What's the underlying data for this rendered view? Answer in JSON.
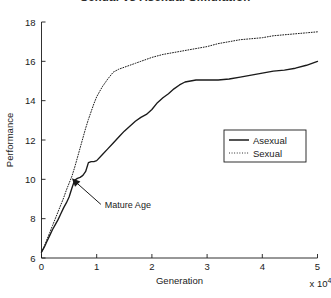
{
  "figure": {
    "title": "Sexual vs Asexual Simulation",
    "background_color": "#ffffff",
    "axis_color": "#1a1a1a",
    "series_color": "#1a1a1a"
  },
  "annotation": {
    "label": "Mature Age",
    "target_x": 0.55,
    "target_y": 10.05
  },
  "legend": {
    "position": "center-right",
    "entries": [
      {
        "label": "Asexual",
        "style": "solid"
      },
      {
        "label": "Sexual",
        "style": "dotted"
      }
    ]
  },
  "axis_text": {
    "exponent_base": "x 10",
    "exponent_power": "4"
  },
  "chart_data": {
    "type": "line",
    "title": "Sexual vs Asexual Simulation",
    "xlabel": "Generation",
    "ylabel": "Performance",
    "x_multiplier": "x 10^4",
    "xlim": [
      0,
      5
    ],
    "ylim": [
      6,
      18
    ],
    "xticks": [
      0,
      1,
      2,
      3,
      4,
      5
    ],
    "yticks": [
      6,
      8,
      10,
      12,
      14,
      16,
      18
    ],
    "grid": false,
    "legend_position": "center-right",
    "annotations": [
      {
        "text": "Mature Age",
        "x": 0.55,
        "y": 10.05
      }
    ],
    "series": [
      {
        "name": "Asexual",
        "style": "solid",
        "x": [
          0.0,
          0.05,
          0.1,
          0.15,
          0.2,
          0.25,
          0.3,
          0.35,
          0.4,
          0.45,
          0.5,
          0.55,
          0.6,
          0.65,
          0.7,
          0.75,
          0.8,
          0.85,
          0.9,
          0.95,
          1.0,
          1.1,
          1.2,
          1.3,
          1.4,
          1.5,
          1.6,
          1.7,
          1.8,
          1.9,
          2.0,
          2.1,
          2.2,
          2.3,
          2.4,
          2.5,
          2.6,
          2.7,
          2.8,
          2.9,
          3.0,
          3.2,
          3.4,
          3.6,
          3.8,
          4.0,
          4.2,
          4.4,
          4.6,
          4.8,
          5.0
        ],
        "y": [
          6.3,
          6.55,
          6.85,
          7.15,
          7.45,
          7.7,
          7.95,
          8.25,
          8.55,
          8.8,
          9.1,
          9.55,
          9.95,
          10.05,
          10.1,
          10.2,
          10.4,
          10.85,
          10.9,
          10.9,
          10.95,
          11.25,
          11.55,
          11.85,
          12.15,
          12.45,
          12.7,
          12.95,
          13.15,
          13.3,
          13.55,
          13.9,
          14.15,
          14.35,
          14.6,
          14.8,
          14.95,
          15.0,
          15.05,
          15.05,
          15.05,
          15.05,
          15.1,
          15.2,
          15.3,
          15.4,
          15.5,
          15.55,
          15.65,
          15.8,
          16.0
        ]
      },
      {
        "name": "Sexual",
        "style": "dotted",
        "x": [
          0.0,
          0.05,
          0.1,
          0.15,
          0.2,
          0.25,
          0.3,
          0.35,
          0.4,
          0.45,
          0.5,
          0.55,
          0.6,
          0.65,
          0.7,
          0.75,
          0.8,
          0.85,
          0.9,
          0.95,
          1.0,
          1.1,
          1.2,
          1.3,
          1.4,
          1.5,
          1.6,
          1.7,
          1.8,
          1.9,
          2.0,
          2.2,
          2.4,
          2.6,
          2.8,
          3.0,
          3.2,
          3.4,
          3.6,
          3.8,
          4.0,
          4.2,
          4.4,
          4.6,
          4.8,
          5.0
        ],
        "y": [
          6.3,
          6.6,
          6.95,
          7.3,
          7.65,
          8.0,
          8.35,
          8.7,
          9.05,
          9.45,
          9.8,
          10.15,
          10.6,
          11.1,
          11.6,
          12.1,
          12.6,
          13.05,
          13.45,
          13.85,
          14.2,
          14.7,
          15.1,
          15.45,
          15.6,
          15.7,
          15.8,
          15.9,
          16.0,
          16.1,
          16.2,
          16.35,
          16.45,
          16.55,
          16.65,
          16.75,
          16.9,
          17.0,
          17.1,
          17.15,
          17.2,
          17.3,
          17.35,
          17.4,
          17.45,
          17.5
        ]
      }
    ]
  }
}
